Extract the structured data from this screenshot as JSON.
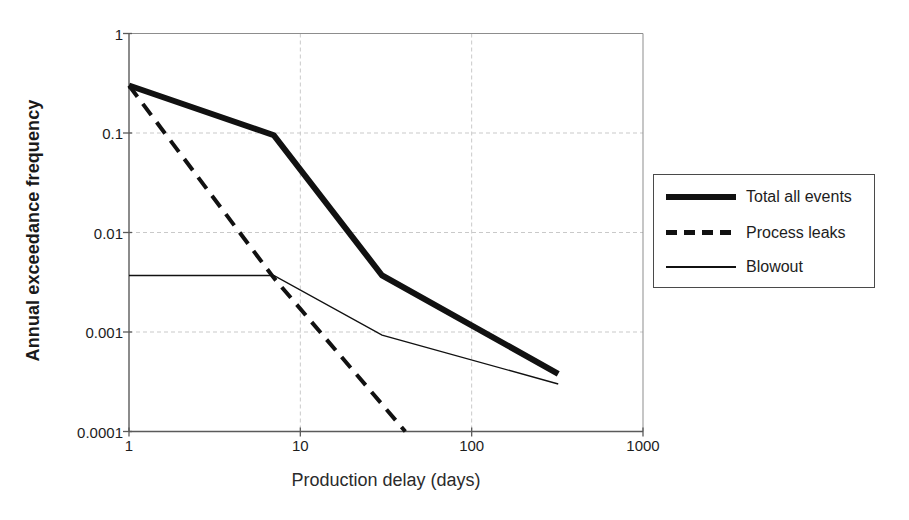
{
  "chart_data": {
    "type": "line",
    "title": "",
    "xlabel": "Production delay (days)",
    "ylabel": "Annual exceedance frequency",
    "xscale": "log",
    "yscale": "log",
    "xlim": [
      1,
      1000
    ],
    "ylim": [
      0.0001,
      1
    ],
    "xticks": [
      "1",
      "10",
      "100",
      "1000"
    ],
    "xtick_values": [
      1,
      10,
      100,
      1000
    ],
    "yticks": [
      "1",
      "0.1",
      "0.01",
      "0.001",
      "0.0001"
    ],
    "ytick_values": [
      1,
      0.1,
      0.01,
      0.001,
      0.0001
    ],
    "grid": true,
    "grid_style": "dashed light gray at decades, both axes",
    "legend_position": "right, outside plot area",
    "series": [
      {
        "name": "Total all events",
        "style": "thick solid",
        "color": "#111111",
        "linewidth": 6,
        "points": [
          {
            "x": 1,
            "y": 0.3
          },
          {
            "x": 7,
            "y": 0.095
          },
          {
            "x": 30,
            "y": 0.0037
          },
          {
            "x": 320,
            "y": 0.00038
          }
        ]
      },
      {
        "name": "Process leaks",
        "style": "dashed",
        "color": "#111111",
        "linewidth": 4,
        "points": [
          {
            "x": 1,
            "y": 0.3
          },
          {
            "x": 7,
            "y": 0.0035
          },
          {
            "x": 41,
            "y": 0.0001
          }
        ]
      },
      {
        "name": "Blowout",
        "style": "thin solid",
        "color": "#111111",
        "linewidth": 1.4,
        "points": [
          {
            "x": 1,
            "y": 0.0037
          },
          {
            "x": 7,
            "y": 0.0037
          },
          {
            "x": 30,
            "y": 0.00093
          },
          {
            "x": 320,
            "y": 0.0003
          }
        ]
      }
    ]
  },
  "legend": {
    "items": [
      {
        "label": "Total all events",
        "style": "thick"
      },
      {
        "label": "Process leaks",
        "style": "dashed"
      },
      {
        "label": "Blowout",
        "style": "thin"
      }
    ]
  }
}
